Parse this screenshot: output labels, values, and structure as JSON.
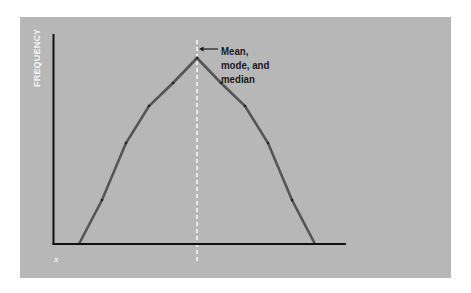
{
  "chart_data": {
    "type": "line",
    "title": "",
    "xlabel": "x",
    "ylabel": "FREQUENCY",
    "grid": false,
    "legend": null,
    "x": [
      0,
      1,
      2,
      3,
      4,
      5,
      6,
      7,
      8,
      9,
      10
    ],
    "series": [
      {
        "name": "frequency",
        "values": [
          0,
          22,
          50,
          69,
          80,
          93,
          80,
          69,
          50,
          22,
          0
        ]
      }
    ],
    "ylim": [
      0,
      100
    ],
    "annotations": [
      {
        "text": "Mean, mode, and median",
        "x": 5,
        "type": "dashed-vertical-line-with-arrow"
      }
    ],
    "pixel_points": [
      [
        79,
        244
      ],
      [
        102,
        200
      ],
      [
        126,
        143
      ],
      [
        149,
        106
      ],
      [
        173,
        83
      ],
      [
        197,
        58
      ],
      [
        221,
        83
      ],
      [
        245,
        106
      ],
      [
        268,
        143
      ],
      [
        292,
        200
      ],
      [
        315,
        244
      ]
    ]
  },
  "labels": {
    "y_axis": "FREQUENCY",
    "x_axis": "x",
    "annotation_lines": [
      "Mean,",
      "mode, and",
      "median"
    ]
  },
  "colors": {
    "panel_background": "#b7b7b7",
    "curve": "#555555",
    "axes": "#111111",
    "center_line": "#ffffff",
    "axis_label": "#f2f2f2",
    "annotation_text": "#1a1a1a"
  }
}
